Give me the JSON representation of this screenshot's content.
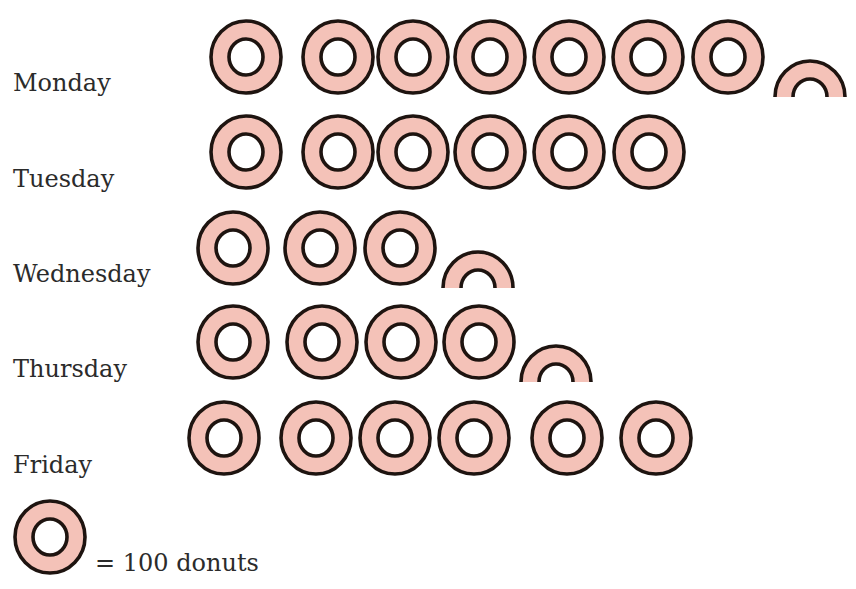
{
  "colors": {
    "donut_fill": "#F4C2B8",
    "donut_stroke": "#1e1410",
    "hole_fill": "#ffffff",
    "text": "#2b2b2b"
  },
  "legend": {
    "icon": "donut-icon",
    "text": "= 100 donuts",
    "unit_value": 100
  },
  "rows": [
    {
      "label": "Monday",
      "label_top": 69,
      "cy": 57,
      "donuts": [
        246,
        338,
        413,
        490,
        569,
        648,
        728
      ],
      "half": 810,
      "half_cut": 97
    },
    {
      "label": "Tuesday",
      "label_top": 165,
      "cy": 152,
      "donuts": [
        246,
        338,
        413,
        490,
        569,
        649
      ],
      "half": null,
      "half_cut": null
    },
    {
      "label": "Wednesday",
      "label_top": 260,
      "cy": 248,
      "donuts": [
        233,
        320,
        400
      ],
      "half": 478,
      "half_cut": 288
    },
    {
      "label": "Thursday",
      "label_top": 355,
      "cy": 342,
      "donuts": [
        233,
        322,
        401,
        479
      ],
      "half": 556,
      "half_cut": 382
    },
    {
      "label": "Friday",
      "label_top": 451,
      "cy": 438,
      "donuts": [
        224,
        316,
        395,
        474,
        567,
        656
      ],
      "half": null,
      "half_cut": null
    }
  ],
  "legend_icon_pos": {
    "cx": 50,
    "cy": 537
  },
  "chart_data": {
    "type": "pictograph",
    "title": "",
    "xlabel": "",
    "ylabel": "",
    "categories": [
      "Monday",
      "Tuesday",
      "Wednesday",
      "Thursday",
      "Friday"
    ],
    "symbol_counts": [
      7.5,
      6,
      3.5,
      4.5,
      6
    ],
    "values": [
      750,
      600,
      350,
      450,
      600
    ],
    "symbol": "donut",
    "key": "1 donut symbol = 100 donuts",
    "legend_position": "bottom-left",
    "grid": false
  }
}
